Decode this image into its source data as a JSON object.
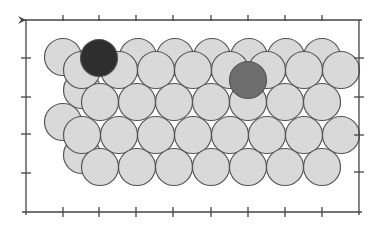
{
  "diagram": {
    "type": "atomic-surface-model",
    "colors": {
      "background": "#ffffff",
      "substrate_atom_fill": "#d9d9d9",
      "atom_outline": "#555555",
      "adsorbate_dark": "#2e2e2e",
      "adsorbate_medium": "#6e6e6e",
      "frame": "#444444"
    },
    "atom_radius": 18.5,
    "frame": {
      "left": 26,
      "top": 20,
      "right": 359,
      "bottom": 212
    },
    "ticks": {
      "top_x": [
        63,
        99,
        136,
        173,
        211,
        248,
        285,
        322
      ],
      "bottom_x": [
        63,
        99,
        136,
        173,
        211,
        248,
        285,
        322
      ],
      "left_y": [
        58,
        97,
        134,
        173
      ],
      "right_y": [
        58,
        97,
        135,
        172
      ]
    },
    "back_layer_atoms": [
      [
        63,
        57
      ],
      [
        138,
        57
      ],
      [
        175,
        57
      ],
      [
        212,
        57
      ],
      [
        249,
        57
      ],
      [
        286,
        57
      ],
      [
        322,
        57
      ],
      [
        82,
        90
      ],
      [
        63,
        122
      ],
      [
        82,
        155
      ]
    ],
    "front_layer_rows": [
      {
        "y": 70,
        "x": [
          82,
          119,
          156,
          193,
          230,
          267,
          304,
          341
        ]
      },
      {
        "y": 102,
        "x": [
          100,
          137,
          174,
          211,
          248,
          285,
          322
        ]
      },
      {
        "y": 135,
        "x": [
          82,
          119,
          156,
          193,
          230,
          267,
          304,
          341
        ]
      },
      {
        "y": 167,
        "x": [
          100,
          137,
          174,
          211,
          248,
          285,
          322
        ]
      }
    ],
    "adsorbates": [
      {
        "name": "dark-adsorbate",
        "cx": 99,
        "cy": 58,
        "color": "dark"
      },
      {
        "name": "gray-adsorbate",
        "cx": 248,
        "cy": 80,
        "color": "medium"
      }
    ]
  }
}
